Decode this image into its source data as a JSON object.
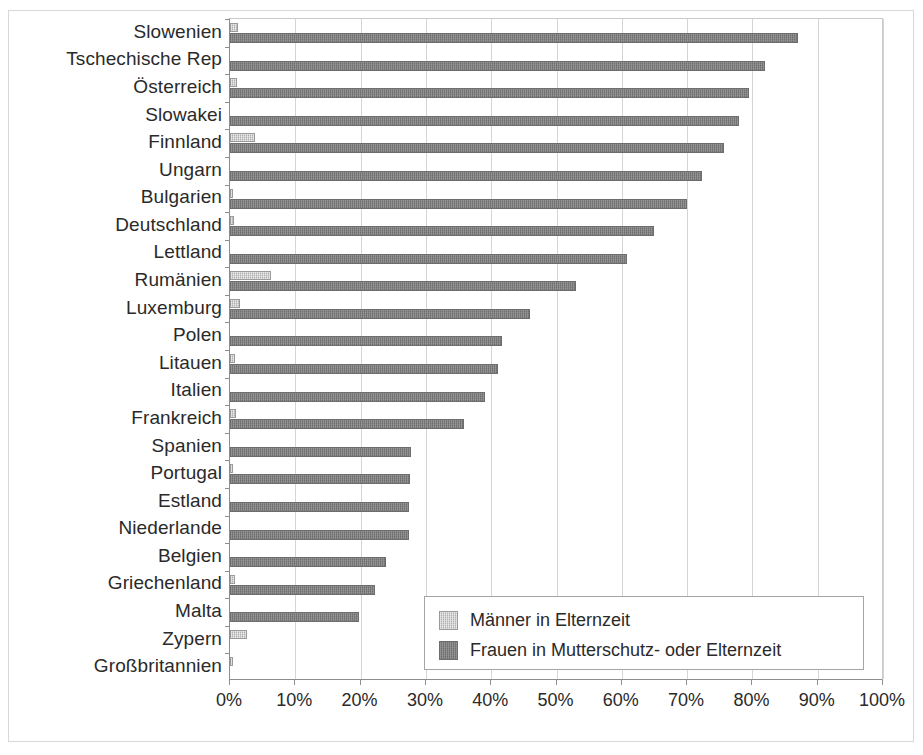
{
  "chart_data": {
    "type": "bar",
    "orientation": "horizontal",
    "title": "",
    "subtitle": "",
    "xlabel": "",
    "ylabel": "",
    "xlim": [
      0,
      100
    ],
    "xtick_labels": [
      "0%",
      "10%",
      "20%",
      "30%",
      "40%",
      "50%",
      "60%",
      "70%",
      "80%",
      "90%",
      "100%"
    ],
    "xtick_values": [
      0,
      10,
      20,
      30,
      40,
      50,
      60,
      70,
      80,
      90,
      100
    ],
    "grid": true,
    "grid_axis": "x",
    "legend_position": "bottom-right",
    "categories": [
      "Slowenien",
      "Tschechische Rep",
      "Österreich",
      "Slowakei",
      "Finnland",
      "Ungarn",
      "Bulgarien",
      "Deutschland",
      "Lettland",
      "Rumänien",
      "Luxemburg",
      "Polen",
      "Litauen",
      "Italien",
      "Frankreich",
      "Spanien",
      "Portugal",
      "Estland",
      "Niederlande",
      "Belgien",
      "Griechenland",
      "Malta",
      "Zypern",
      "Großbritannien"
    ],
    "series": [
      {
        "name": "Männer in Elternzeit",
        "color": "#b0b0b0",
        "values": [
          1.2,
          0.0,
          1.0,
          0.0,
          3.8,
          0.0,
          0.5,
          0.6,
          0.0,
          6.3,
          1.6,
          0.0,
          0.8,
          0.0,
          0.9,
          0.0,
          0.5,
          0.0,
          0.0,
          0.0,
          0.8,
          0.0,
          2.6,
          0.5
        ]
      },
      {
        "name": "Frauen in Mutterschutz- oder Elternzeit",
        "color": "#7b7b7b",
        "values": [
          87.0,
          82.0,
          79.5,
          78.0,
          75.7,
          72.3,
          70.0,
          65.0,
          60.8,
          53.0,
          46.0,
          41.7,
          41.0,
          39.0,
          35.8,
          27.7,
          27.5,
          27.4,
          27.4,
          23.9,
          22.2,
          19.8,
          0.0,
          0.0
        ]
      }
    ]
  },
  "legend": {
    "items": [
      {
        "label": "Männer in Elternzeit",
        "swatch": "light-gray-pattern-swatch"
      },
      {
        "label": "Frauen in Mutterschutz- oder Elternzeit",
        "swatch": "dark-gray-pattern-swatch"
      }
    ]
  }
}
